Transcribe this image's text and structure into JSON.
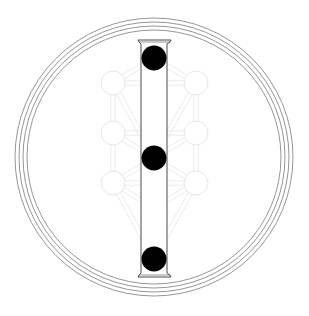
{
  "diagram": {
    "colors": {
      "background": "#ffffff",
      "rings": "#8a8a8a",
      "lattice": "#e6e6e6",
      "pillar_outline": "#4a4a4a",
      "highlighted_sephirot": "#000000"
    },
    "rings": {
      "center": [
        154,
        157
      ],
      "radii": [
        139,
        135,
        131,
        127
      ]
    },
    "pillar": {
      "shaft": {
        "x1": 141,
        "x2": 167,
        "y1": 44,
        "y2": 273
      },
      "capital": {
        "x1": 138,
        "x2": 171,
        "y": 40
      },
      "base": {
        "x1": 138,
        "x2": 171,
        "y": 277
      }
    },
    "sephirot": [
      {
        "id": "keter",
        "x": 154,
        "y": 58,
        "r": 12.5,
        "highlighted": true
      },
      {
        "id": "chokmah",
        "x": 196,
        "y": 83,
        "r": 12,
        "highlighted": false
      },
      {
        "id": "binah",
        "x": 113,
        "y": 83,
        "r": 12,
        "highlighted": false
      },
      {
        "id": "daat",
        "x": 154,
        "y": 108,
        "r": 12,
        "highlighted": false
      },
      {
        "id": "chesed",
        "x": 196,
        "y": 133,
        "r": 12,
        "highlighted": false
      },
      {
        "id": "gevurah",
        "x": 113,
        "y": 133,
        "r": 12,
        "highlighted": false
      },
      {
        "id": "tiferet",
        "x": 154,
        "y": 158,
        "r": 12.5,
        "highlighted": true
      },
      {
        "id": "netzach",
        "x": 196,
        "y": 183,
        "r": 12,
        "highlighted": false
      },
      {
        "id": "hod",
        "x": 113,
        "y": 183,
        "r": 12,
        "highlighted": false
      },
      {
        "id": "yesod",
        "x": 154,
        "y": 208,
        "r": 12,
        "highlighted": false
      },
      {
        "id": "malkuth",
        "x": 154,
        "y": 259,
        "r": 12.5,
        "highlighted": true
      }
    ],
    "paths": [
      [
        "keter",
        "chokmah"
      ],
      [
        "keter",
        "binah"
      ],
      [
        "keter",
        "tiferet"
      ],
      [
        "chokmah",
        "binah"
      ],
      [
        "chokmah",
        "chesed"
      ],
      [
        "chokmah",
        "tiferet"
      ],
      [
        "binah",
        "gevurah"
      ],
      [
        "binah",
        "tiferet"
      ],
      [
        "chesed",
        "gevurah"
      ],
      [
        "chesed",
        "tiferet"
      ],
      [
        "chesed",
        "netzach"
      ],
      [
        "gevurah",
        "tiferet"
      ],
      [
        "gevurah",
        "hod"
      ],
      [
        "tiferet",
        "netzach"
      ],
      [
        "tiferet",
        "hod"
      ],
      [
        "tiferet",
        "yesod"
      ],
      [
        "netzach",
        "hod"
      ],
      [
        "netzach",
        "yesod"
      ],
      [
        "netzach",
        "malkuth"
      ],
      [
        "hod",
        "yesod"
      ],
      [
        "hod",
        "malkuth"
      ],
      [
        "yesod",
        "malkuth"
      ]
    ]
  }
}
